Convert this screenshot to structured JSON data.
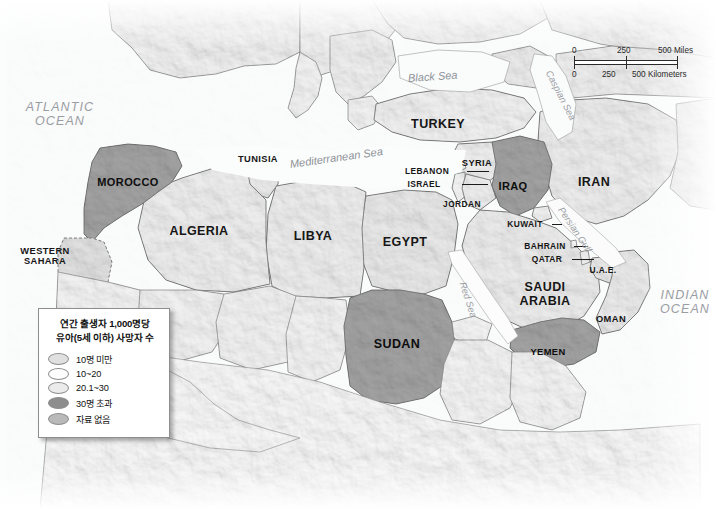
{
  "map": {
    "title": "Under-five mortality in North Africa and the Middle East",
    "background_color": "#ffffff",
    "fills": {
      "under_10": "#e3e3e3",
      "ten_to_twenty": "#fdfdfd",
      "twenty_to_thirty": "#ebebeb",
      "over_thirty": "#8d8d8d",
      "no_data": "#b9b9b9",
      "neighbor_land": "#e9e9e9",
      "water": "#fbfbfb",
      "border_line": "#5f5f5f"
    }
  },
  "legend": {
    "title_line1": "연간 출생자 1,000명당",
    "title_line2": "유아(5세 이하) 사망자 수",
    "items": [
      {
        "label": "10명 미만",
        "color": "#e0e0e0"
      },
      {
        "label": "10~20",
        "color": "#fdfdfd"
      },
      {
        "label": "20.1~30",
        "color": "#ebebeb"
      },
      {
        "label": "30명 초과",
        "color": "#8d8d8d"
      },
      {
        "label": "자료 없음",
        "color": "#b9b9b9"
      }
    ]
  },
  "scalebar": {
    "miles": {
      "zero": "0",
      "mid": "250",
      "max": "500 Miles"
    },
    "kilometers": {
      "zero": "0",
      "mid": "250",
      "max": "500 Kilometers"
    }
  },
  "labels": {
    "oceans": [
      {
        "name": "atlantic-ocean",
        "line1": "ATLANTIC",
        "line2": "OCEAN",
        "x": 60,
        "y": 100
      },
      {
        "name": "indian-ocean",
        "line1": "INDIAN",
        "line2": "OCEAN",
        "x": 685,
        "y": 288
      }
    ],
    "seas": [
      {
        "name": "mediterranean-sea",
        "text": "Mediterranean Sea",
        "x": 290,
        "y": 158,
        "rotate": -8,
        "size": "sea"
      },
      {
        "name": "black-sea",
        "text": "Black Sea",
        "x": 408,
        "y": 72,
        "rotate": -4,
        "size": "sea"
      },
      {
        "name": "caspian-sea",
        "text": "Caspian Sea",
        "x": 548,
        "y": 66,
        "rotate": 63,
        "size": "sea-sm"
      },
      {
        "name": "red-sea",
        "text": "Red Sea",
        "x": 462,
        "y": 277,
        "rotate": 72,
        "size": "sea-sm"
      },
      {
        "name": "persian-gulf",
        "text": "Persian Gulf",
        "x": 560,
        "y": 203,
        "rotate": 56,
        "size": "sea-sm"
      }
    ],
    "countries": [
      {
        "name": "morocco",
        "text": "MOROCCO",
        "x": 128,
        "y": 176,
        "cls": "c-md",
        "highlight": true
      },
      {
        "name": "western-sahara",
        "text": "WESTERN\nSAHARA",
        "x": 45,
        "y": 246,
        "cls": "c-sm",
        "highlight": false
      },
      {
        "name": "algeria",
        "text": "ALGERIA",
        "x": 199,
        "y": 224,
        "cls": "c-lg",
        "highlight": false
      },
      {
        "name": "tunisia",
        "text": "TUNISIA",
        "x": 258,
        "y": 154,
        "cls": "c-sm",
        "highlight": false
      },
      {
        "name": "libya",
        "text": "LIBYA",
        "x": 313,
        "y": 229,
        "cls": "c-lg",
        "highlight": false
      },
      {
        "name": "egypt",
        "text": "EGYPT",
        "x": 405,
        "y": 235,
        "cls": "c-lg",
        "highlight": false
      },
      {
        "name": "sudan",
        "text": "SUDAN",
        "x": 397,
        "y": 337,
        "cls": "c-lg",
        "highlight": true
      },
      {
        "name": "turkey",
        "text": "TURKEY",
        "x": 438,
        "y": 117,
        "cls": "c-lg",
        "highlight": false
      },
      {
        "name": "syria",
        "text": "SYRIA",
        "x": 477,
        "y": 158,
        "cls": "c-sm",
        "highlight": false
      },
      {
        "name": "lebanon",
        "text": "LEBANON",
        "x": 427,
        "y": 167,
        "cls": "c-xs",
        "highlight": false
      },
      {
        "name": "israel",
        "text": "ISRAEL",
        "x": 424,
        "y": 180,
        "cls": "c-xs",
        "highlight": false
      },
      {
        "name": "jordan",
        "text": "JORDAN",
        "x": 462,
        "y": 200,
        "cls": "c-xs",
        "highlight": false
      },
      {
        "name": "iraq",
        "text": "IRAQ",
        "x": 513,
        "y": 180,
        "cls": "c-md",
        "highlight": true
      },
      {
        "name": "iran",
        "text": "IRAN",
        "x": 594,
        "y": 175,
        "cls": "c-lg",
        "highlight": false
      },
      {
        "name": "kuwait",
        "text": "KUWAIT",
        "x": 525,
        "y": 220,
        "cls": "c-xs",
        "highlight": false
      },
      {
        "name": "bahrain",
        "text": "BAHRAIN",
        "x": 545,
        "y": 242,
        "cls": "c-xs",
        "highlight": false
      },
      {
        "name": "qatar",
        "text": "QATAR",
        "x": 547,
        "y": 255,
        "cls": "c-xs",
        "highlight": false
      },
      {
        "name": "uae",
        "text": "U.A.E.",
        "x": 603,
        "y": 266,
        "cls": "c-xs",
        "highlight": false
      },
      {
        "name": "saudi-arabia",
        "text": "SAUDI\nARABIA",
        "x": 545,
        "y": 280,
        "cls": "c-lg",
        "highlight": false
      },
      {
        "name": "oman",
        "text": "OMAN",
        "x": 611,
        "y": 314,
        "cls": "c-sm",
        "highlight": false
      },
      {
        "name": "yemen",
        "text": "YEMEN",
        "x": 548,
        "y": 347,
        "cls": "c-sm",
        "highlight": true
      }
    ]
  }
}
